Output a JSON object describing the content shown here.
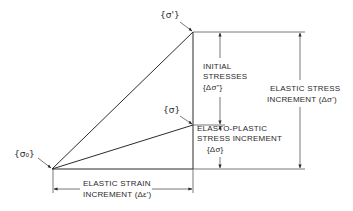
{
  "diagram": {
    "points": {
      "origin": "{σ₀}",
      "elastic_point": "{σ'}",
      "actual_point": "{σ}"
    },
    "labels": {
      "initial_stresses": {
        "line1": "INITIAL",
        "line2": "STRESSES",
        "line3": "{Δσ\"}"
      },
      "elastic_stress_increment": {
        "line1": "ELASTIC  STRESS",
        "line2": "INCREMENT (Δσ')"
      },
      "elasto_plastic_increment": {
        "line1": "ELASTO-PLASTIC",
        "line2": "STRESS    INCREMENT",
        "line3": "{Δσ}"
      },
      "elastic_strain_increment": {
        "line1": "ELASTIC  STRAIN",
        "line2": "INCREMENT (Δε')"
      }
    },
    "colors": {
      "line": "#2b2b2b",
      "text": "#2a2a2a",
      "background": "#ffffff"
    }
  }
}
